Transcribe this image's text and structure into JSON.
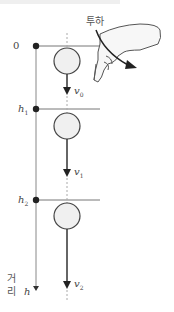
{
  "diagram": {
    "title_action": "투하",
    "axis_label": "거리",
    "axis_label_chars": [
      "거",
      "리"
    ],
    "axis_variable": "h",
    "levels": [
      {
        "label": "0",
        "name": "start"
      },
      {
        "label": "h",
        "sub": "1",
        "name": "h1"
      },
      {
        "label": "h",
        "sub": "2",
        "name": "h2"
      }
    ],
    "velocities": [
      {
        "label": "v",
        "sub": "0"
      },
      {
        "label": "v",
        "sub": "1"
      },
      {
        "label": "v",
        "sub": "2"
      }
    ],
    "colors": {
      "line": "#555555",
      "ball_fill": "#f0f0f0",
      "ball_stroke": "#444444",
      "dot": "#222222",
      "dash": "#aaaaaa"
    }
  }
}
